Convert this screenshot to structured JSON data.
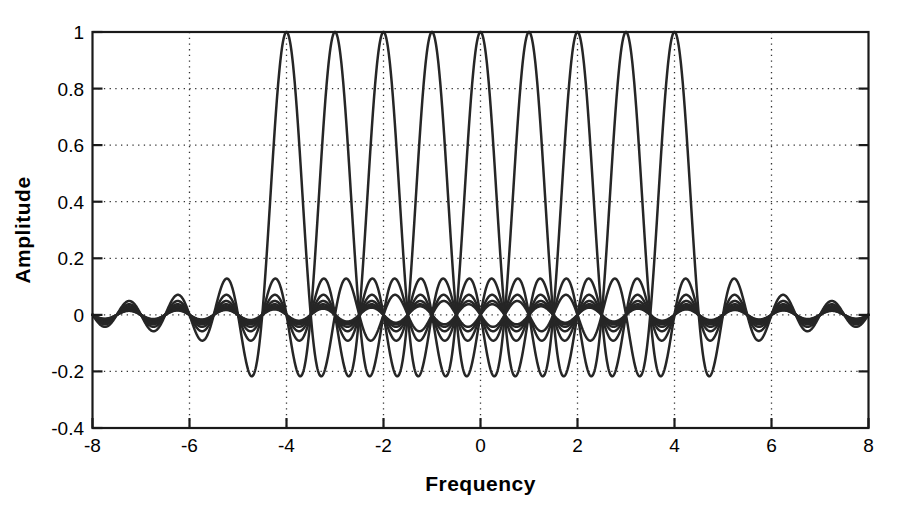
{
  "chart_data": {
    "type": "line",
    "title": "",
    "xlabel": "Frequency",
    "ylabel": "Amplitude",
    "xlim": [
      -8,
      8
    ],
    "ylim": [
      -0.4,
      1
    ],
    "grid": true,
    "legend_position": "none",
    "xticks": [
      -8,
      -6,
      -4,
      -2,
      0,
      2,
      4,
      6,
      8
    ],
    "xticklabels": [
      "-8",
      "-6",
      "-4",
      "-2",
      "0",
      "2",
      "4",
      "6",
      "8"
    ],
    "yticks": [
      -0.4,
      -0.2,
      0,
      0.2,
      0.4,
      0.6,
      0.8,
      1
    ],
    "yticklabels": [
      "-0.4",
      "-0.2",
      "0",
      "0.2",
      "0.4",
      "0.6",
      "0.8",
      "1"
    ],
    "series_peak_centers": [
      -4,
      -3,
      -2,
      -1,
      0,
      1,
      2,
      3,
      4
    ],
    "series_count": 9,
    "null_spacing": 0.5,
    "peak_amplitude": 1,
    "first_sidelobe_amplitude": -0.215,
    "second_sidelobe_amplitude": 0.13,
    "series": [
      {
        "name": "subcarrier -4",
        "center": -4,
        "peak": 1
      },
      {
        "name": "subcarrier -3",
        "center": -3,
        "peak": 1
      },
      {
        "name": "subcarrier -2",
        "center": -2,
        "peak": 1
      },
      {
        "name": "subcarrier -1",
        "center": -1,
        "peak": 1
      },
      {
        "name": "subcarrier 0",
        "center": 0,
        "peak": 1
      },
      {
        "name": "subcarrier 1",
        "center": 1,
        "peak": 1
      },
      {
        "name": "subcarrier 2",
        "center": 2,
        "peak": 1
      },
      {
        "name": "subcarrier 3",
        "center": 3,
        "peak": 1
      },
      {
        "name": "subcarrier 4",
        "center": 4,
        "peak": 1
      }
    ]
  },
  "axes": {
    "x_axis_label": "Frequency",
    "y_axis_label": "Amplitude",
    "x_tick_labels": [
      "-8",
      "-6",
      "-4",
      "-2",
      "0",
      "2",
      "4",
      "6",
      "8"
    ],
    "y_tick_labels": [
      "1",
      "0.8",
      "0.6",
      "0.4",
      "0.2",
      "0",
      "-0.2",
      "-0.4"
    ]
  },
  "colors": {
    "curve": "#262626",
    "frame": "#1a1a1a",
    "grid": "#333333",
    "background": "#ffffff",
    "text": "#000000"
  }
}
